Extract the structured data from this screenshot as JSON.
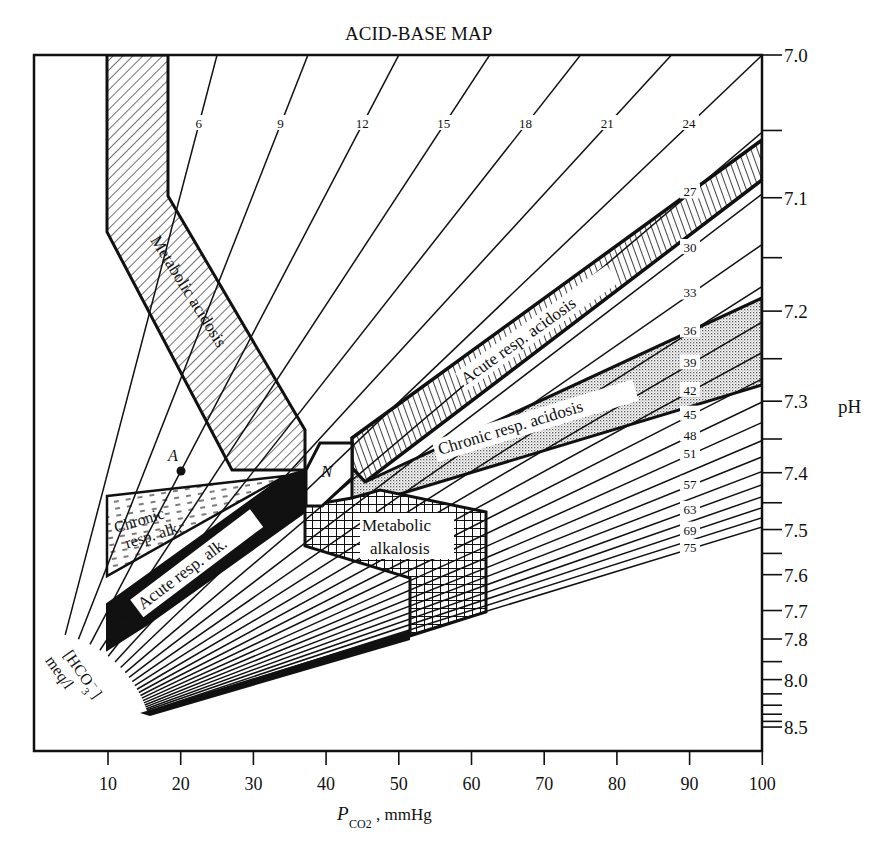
{
  "chart_data": {
    "type": "line",
    "title": "ACID-BASE MAP",
    "xlabel": "P_CO2, mmHg",
    "xlabel_main": "P",
    "xlabel_sub": "CO2",
    "xlabel_unit": ", mmHg",
    "ylabel": "pH",
    "xlim": [
      0,
      100
    ],
    "x_ticks": [
      10,
      20,
      30,
      40,
      50,
      60,
      70,
      80,
      90,
      100
    ],
    "y_ticks_labeled": [
      "7.0",
      "7.1",
      "7.2",
      "7.3",
      "7.4",
      "7.5",
      "7.6",
      "7.7",
      "7.8",
      "8.0",
      "8.5"
    ],
    "y_ticks_all": [
      7.0,
      7.05,
      7.1,
      7.15,
      7.2,
      7.25,
      7.3,
      7.35,
      7.4,
      7.45,
      7.5,
      7.55,
      7.6,
      7.7,
      7.8,
      7.9,
      8.0,
      8.1,
      8.2,
      8.3,
      8.4,
      8.5
    ],
    "isopleth_label": "[HCO3−] meq/l",
    "isopleth_label_line1": "[HCO",
    "isopleth_label_line2": "meq/l",
    "series": [
      {
        "name": "6",
        "hco3": 6,
        "labeled": true
      },
      {
        "name": "9",
        "hco3": 9,
        "labeled": true
      },
      {
        "name": "12",
        "hco3": 12,
        "labeled": true
      },
      {
        "name": "15",
        "hco3": 15,
        "labeled": true
      },
      {
        "name": "18",
        "hco3": 18,
        "labeled": true
      },
      {
        "name": "21",
        "hco3": 21,
        "labeled": true
      },
      {
        "name": "24",
        "hco3": 24,
        "labeled": true
      },
      {
        "name": "27",
        "hco3": 27,
        "labeled": true
      },
      {
        "name": "30",
        "hco3": 30,
        "labeled": true
      },
      {
        "name": "33",
        "hco3": 33,
        "labeled": true
      },
      {
        "name": "36",
        "hco3": 36,
        "labeled": true
      },
      {
        "name": "39",
        "hco3": 39,
        "labeled": true
      },
      {
        "name": "42",
        "hco3": 42,
        "labeled": true
      },
      {
        "name": "45",
        "hco3": 45,
        "labeled": true
      },
      {
        "name": "48",
        "hco3": 48,
        "labeled": true
      },
      {
        "name": "51",
        "hco3": 51,
        "labeled": true
      },
      {
        "name": "54",
        "hco3": 54,
        "labeled": false
      },
      {
        "name": "57",
        "hco3": 57,
        "labeled": true
      },
      {
        "name": "60",
        "hco3": 60,
        "labeled": false
      },
      {
        "name": "63",
        "hco3": 63,
        "labeled": true
      },
      {
        "name": "66",
        "hco3": 66,
        "labeled": false
      },
      {
        "name": "69",
        "hco3": 69,
        "labeled": true
      },
      {
        "name": "72",
        "hco3": 72,
        "labeled": false
      },
      {
        "name": "75",
        "hco3": 75,
        "labeled": true
      }
    ],
    "regions": [
      {
        "name": "Metabolic acidosis",
        "pattern": "diagonal-hatch"
      },
      {
        "name": "Acute resp. acidosis",
        "pattern": "vertical-hatch"
      },
      {
        "name": "Chronic resp. acidosis",
        "pattern": "stipple"
      },
      {
        "name": "Metabolic alkalosis",
        "pattern": "cross-hatch"
      },
      {
        "name": "Chronic resp. alk.",
        "pattern": "dashes"
      },
      {
        "name": "Acute resp. alk.",
        "pattern": "solid-black"
      },
      {
        "name": "N",
        "pattern": "blank",
        "note": "normal"
      }
    ],
    "annotations": [
      {
        "text": "A",
        "x": 20,
        "pH": 7.38,
        "type": "point"
      }
    ],
    "grid": false,
    "legend": "none"
  },
  "labels": {
    "title": "ACID-BASE MAP",
    "ph": "pH",
    "metabolic_acidosis": "Metabolic acidosis",
    "acute_resp_acidosis": "Acute resp. acidosis",
    "chronic_resp_acidosis": "Chronic resp. acidosis",
    "metabolic_alkalosis_1": "Metabolic",
    "metabolic_alkalosis_2": "alkalosis",
    "chronic_resp_alk_1": "Chronic",
    "chronic_resp_alk_2": "resp. alk.",
    "acute_resp_alk": "Acute resp. alk.",
    "normal": "N",
    "point_a": "A"
  }
}
